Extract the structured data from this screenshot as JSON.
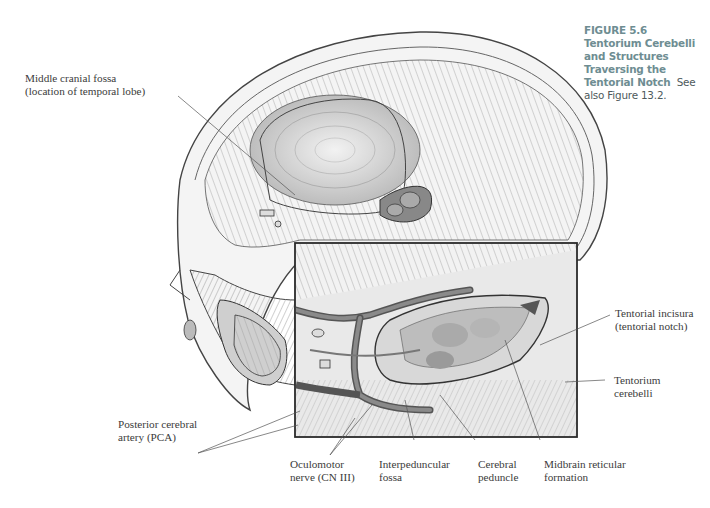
{
  "figure": {
    "number": "FIGURE 5.6",
    "title_line1": "Tentorium Cerebelli",
    "title_line2": "and Structures Traversing the",
    "title_line3": "Tentorial Notch",
    "see_also": "See also Figure 13.2."
  },
  "labels": {
    "middle_cranial_fossa": {
      "line1": "Middle cranial fossa",
      "line2": "(location of temporal lobe)"
    },
    "tentorial_incisura": {
      "line1": "Tentorial incisura",
      "line2": "(tentorial notch)"
    },
    "tentorium_cerebelli": {
      "line1": "Tentorium",
      "line2": "cerebelli"
    },
    "posterior_cerebral_artery": {
      "line1": "Posterior cerebral",
      "line2": "artery (PCA)"
    },
    "oculomotor_nerve": {
      "line1": "Oculomotor",
      "line2": "nerve (CN III)"
    },
    "interpeduncular_fossa": {
      "line1": "Interpeduncular",
      "line2": "fossa"
    },
    "cerebral_peduncle": {
      "line1": "Cerebral",
      "line2": "peduncle"
    },
    "midbrain_reticular_formation": {
      "line1": "Midbrain reticular",
      "line2": "formation"
    }
  },
  "colors": {
    "caption": "#6e8d92",
    "label_text": "#3b3b3b",
    "leader_lines": "#555555",
    "inset_border": "#2a2a2a"
  }
}
